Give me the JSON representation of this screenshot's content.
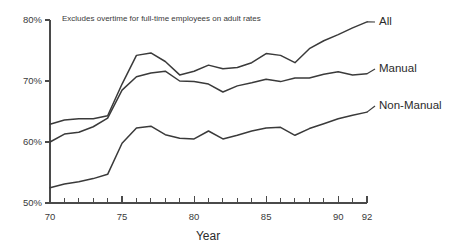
{
  "chart_data": {
    "type": "line",
    "title": "",
    "subtitle": "Excludes overtime for full-time employees on adult rates",
    "xlabel": "Year",
    "ylabel": "",
    "xlim": [
      70,
      92
    ],
    "ylim": [
      50,
      80
    ],
    "grid": false,
    "legend_position": "right-inline-labels",
    "y_tick_labels": [
      "50%",
      "60%",
      "70%",
      "80%"
    ],
    "y_ticks": [
      50,
      60,
      70,
      80
    ],
    "x_tick_labels": [
      "70",
      "75",
      "80",
      "85",
      "90",
      "92"
    ],
    "x_major_ticks": [
      70,
      75,
      80,
      85,
      90,
      92
    ],
    "x_minor_ticks": [
      71,
      72,
      73,
      74,
      76,
      77,
      78,
      79,
      81,
      82,
      83,
      84,
      86,
      87,
      88,
      89,
      91
    ],
    "x": [
      70,
      71,
      72,
      73,
      74,
      75,
      76,
      77,
      78,
      79,
      80,
      81,
      82,
      83,
      84,
      85,
      86,
      87,
      88,
      89,
      90,
      91,
      92
    ],
    "series": [
      {
        "name": "All",
        "label": "All",
        "color": "#3a3a3a",
        "values": [
          62.9,
          63.6,
          63.8,
          63.8,
          64.3,
          69.5,
          74.2,
          74.6,
          73.2,
          71.0,
          71.6,
          72.6,
          72.0,
          72.2,
          73.0,
          74.5,
          74.2,
          73.0,
          75.3,
          76.6,
          77.6,
          78.7,
          79.7
        ]
      },
      {
        "name": "Manual",
        "label": "Manual",
        "color": "#3a3a3a",
        "values": [
          60.0,
          61.3,
          61.6,
          62.5,
          63.9,
          68.5,
          70.7,
          71.3,
          71.6,
          70.0,
          69.9,
          69.5,
          68.2,
          69.2,
          69.7,
          70.3,
          69.9,
          70.5,
          70.5,
          71.1,
          71.5,
          71.0,
          71.2
        ]
      },
      {
        "name": "Non-Manual",
        "label": "Non-Manual",
        "color": "#3a3a3a",
        "values": [
          52.5,
          53.1,
          53.5,
          54.0,
          54.7,
          59.8,
          62.3,
          62.6,
          61.2,
          60.6,
          60.5,
          61.8,
          60.5,
          61.1,
          61.8,
          62.3,
          62.4,
          61.1,
          62.2,
          63.0,
          63.8,
          64.4,
          64.9
        ]
      }
    ]
  }
}
